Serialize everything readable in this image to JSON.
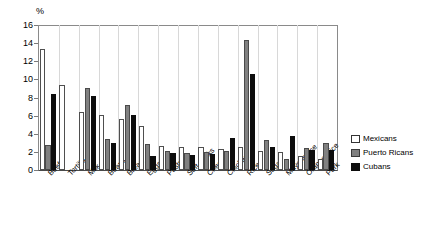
{
  "chart_data": {
    "type": "bar",
    "title": "",
    "subtitle": "",
    "xlabel": "",
    "ylabel": "%",
    "ylim": [
      0,
      16
    ],
    "ytick_step": 2,
    "yticks": [
      "0",
      "2",
      "4",
      "6",
      "8",
      "10",
      "12",
      "14",
      "16"
    ],
    "grid": false,
    "legend_position": "right",
    "categories": [
      "Beef",
      "Tortilla",
      "Milk",
      "Beans",
      "Bread",
      "Eggs",
      "Pastry",
      "Soft drinks",
      "Cheese",
      "Chicken",
      "Rice",
      "Sugar",
      "Mayonnaise",
      "Orange juice",
      "Pork"
    ],
    "series": [
      {
        "name": "Mexicans",
        "color": "#ffffff",
        "values": [
          13.4,
          9.4,
          6.4,
          6.1,
          5.6,
          4.9,
          2.6,
          2.5,
          2.5,
          2.3,
          2.5,
          2.1,
          2.0,
          1.5,
          1.2
        ]
      },
      {
        "name": "Puerto Ricans",
        "color": "#808080",
        "values": [
          2.8,
          0,
          9.0,
          3.4,
          7.2,
          2.9,
          2.1,
          1.9,
          2.0,
          2.1,
          14.3,
          3.3,
          1.2,
          2.4,
          3.0
        ]
      },
      {
        "name": "Cubans",
        "color": "#0d0d0d",
        "values": [
          8.4,
          0,
          8.2,
          3.0,
          6.1,
          1.5,
          1.9,
          1.7,
          1.8,
          3.5,
          10.6,
          2.5,
          3.7,
          2.2,
          2.2
        ]
      }
    ]
  },
  "legend": {
    "items": [
      {
        "label": "Mexicans",
        "swatch": "white-square-swatch"
      },
      {
        "label": "Puerto Ricans",
        "swatch": "gray-square-swatch"
      },
      {
        "label": "Cubans",
        "swatch": "black-square-swatch"
      }
    ]
  }
}
